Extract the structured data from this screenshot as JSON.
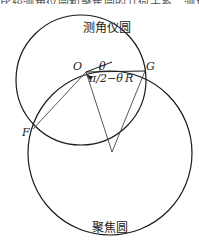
{
  "header": {
    "cut_off_text": "比较测角仪圆和聚焦圆的几何关系，测角仪圆中心为O"
  },
  "circles": {
    "goniometer": {
      "label": "测角仪圆",
      "cx": 81,
      "cy": 80,
      "r": 65
    },
    "focusing": {
      "label": "聚焦圆",
      "cx": 110,
      "cy": 153,
      "r": 82
    }
  },
  "points": {
    "O": {
      "label": "O",
      "x": 86,
      "y": 72
    },
    "G": {
      "label": "G",
      "x": 145,
      "y": 71
    },
    "F": {
      "label": "F",
      "x": 33,
      "y": 129
    },
    "apex": {
      "x": 112,
      "y": 152
    }
  },
  "annotations": {
    "theta": "θ",
    "angle": "π/2−θ",
    "radius": "R"
  },
  "colors": {
    "stroke": "#1a1a1a",
    "thin": "#444444"
  }
}
